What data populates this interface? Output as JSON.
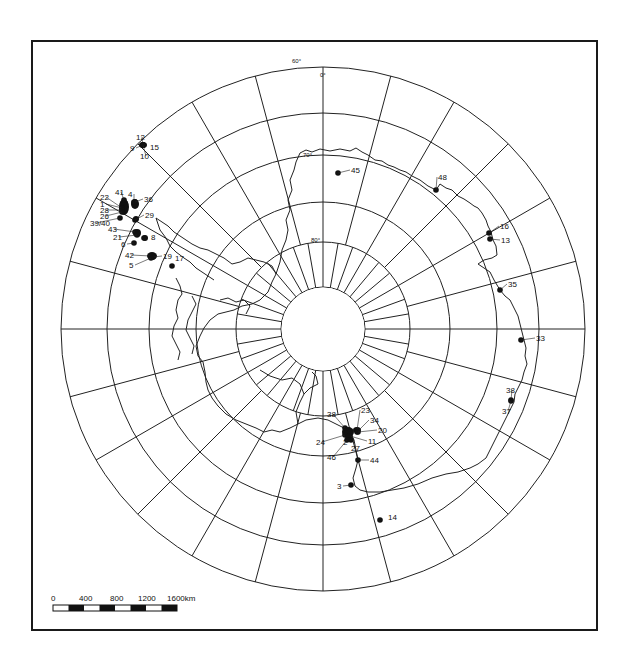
{
  "map": {
    "projection": "south-polar-stereographic",
    "grid_labels": {
      "lat_60": "60°",
      "lon_0": "0°",
      "lat_70": "70°",
      "lat_80": "80°"
    },
    "latitude_rings": [
      "60°",
      "65°",
      "70°",
      "75°",
      "80°",
      "85°"
    ],
    "meridian_spacing_outer_deg": 15,
    "meridian_spacing_inner_deg": 10
  },
  "stations": [
    {
      "label": "12",
      "x": 143,
      "y": 145,
      "lx": 136,
      "ly": 140
    },
    {
      "label": "15",
      "x": 143,
      "y": 145,
      "lx": 150,
      "ly": 150
    },
    {
      "label": "9",
      "x": 143,
      "y": 145,
      "lx": 130,
      "ly": 151
    },
    {
      "label": "10",
      "x": 143,
      "y": 145,
      "lx": 140,
      "ly": 159
    },
    {
      "label": "41",
      "x": 124,
      "y": 200,
      "lx": 115,
      "ly": 195
    },
    {
      "label": "4",
      "x": 134,
      "y": 202,
      "lx": 128,
      "ly": 197
    },
    {
      "label": "36",
      "x": 135,
      "y": 202,
      "lx": 144,
      "ly": 202
    },
    {
      "label": "22",
      "x": 122,
      "y": 208,
      "lx": 100,
      "ly": 200
    },
    {
      "label": "1",
      "x": 122,
      "y": 208,
      "lx": 100,
      "ly": 207
    },
    {
      "label": "28",
      "x": 122,
      "y": 210,
      "lx": 100,
      "ly": 213
    },
    {
      "label": "26",
      "x": 122,
      "y": 212,
      "lx": 100,
      "ly": 219
    },
    {
      "label": "29",
      "x": 135,
      "y": 220,
      "lx": 145,
      "ly": 218
    },
    {
      "label": "39/40",
      "x": 120,
      "y": 218,
      "lx": 90,
      "ly": 226
    },
    {
      "label": "43",
      "x": 135,
      "y": 232,
      "lx": 108,
      "ly": 232
    },
    {
      "label": "21",
      "x": 137,
      "y": 235,
      "lx": 113,
      "ly": 240
    },
    {
      "label": "8",
      "x": 144,
      "y": 238,
      "lx": 151,
      "ly": 240
    },
    {
      "label": "6",
      "x": 134,
      "y": 243,
      "lx": 121,
      "ly": 247
    },
    {
      "label": "42",
      "x": 151,
      "y": 256,
      "lx": 125,
      "ly": 258
    },
    {
      "label": "19",
      "x": 153,
      "y": 257,
      "lx": 163,
      "ly": 259
    },
    {
      "label": "17",
      "x": 172,
      "y": 266,
      "lx": 175,
      "ly": 261
    },
    {
      "label": "5",
      "x": 151,
      "y": 258,
      "lx": 129,
      "ly": 268
    },
    {
      "label": "45",
      "x": 338,
      "y": 173,
      "lx": 351,
      "ly": 173
    },
    {
      "label": "48",
      "x": 436,
      "y": 190,
      "lx": 438,
      "ly": 180
    },
    {
      "label": "16",
      "x": 489,
      "y": 233,
      "lx": 500,
      "ly": 229
    },
    {
      "label": "13",
      "x": 490,
      "y": 239,
      "lx": 501,
      "ly": 243
    },
    {
      "label": "35",
      "x": 500,
      "y": 290,
      "lx": 508,
      "ly": 287
    },
    {
      "label": "33",
      "x": 521,
      "y": 340,
      "lx": 536,
      "ly": 341
    },
    {
      "label": "38",
      "x": 511,
      "y": 400,
      "lx": 506,
      "ly": 393
    },
    {
      "label": "37",
      "x": 511,
      "y": 401,
      "lx": 502,
      "ly": 414
    },
    {
      "label": "38",
      "x": 345,
      "y": 428,
      "lx": 327,
      "ly": 417
    },
    {
      "label": "23",
      "x": 357,
      "y": 430,
      "lx": 361,
      "ly": 413
    },
    {
      "label": "34",
      "x": 357,
      "y": 432,
      "lx": 370,
      "ly": 423
    },
    {
      "label": "20",
      "x": 358,
      "y": 432,
      "lx": 378,
      "ly": 433
    },
    {
      "label": "11",
      "x": 350,
      "y": 436,
      "lx": 368,
      "ly": 444
    },
    {
      "label": "24",
      "x": 345,
      "y": 435,
      "lx": 316,
      "ly": 445
    },
    {
      "label": "2",
      "x": 348,
      "y": 437,
      "lx": 343,
      "ly": 445
    },
    {
      "label": "27",
      "x": 351,
      "y": 440,
      "lx": 351,
      "ly": 451
    },
    {
      "label": "46",
      "x": 347,
      "y": 440,
      "lx": 327,
      "ly": 460
    },
    {
      "label": "44",
      "x": 358,
      "y": 460,
      "lx": 370,
      "ly": 463
    },
    {
      "label": "3",
      "x": 351,
      "y": 485,
      "lx": 337,
      "ly": 489
    },
    {
      "label": "14",
      "x": 380,
      "y": 520,
      "lx": 388,
      "ly": 520
    }
  ],
  "cluster_blobs": [
    {
      "x": 143,
      "y": 145,
      "rx": 4,
      "ry": 3
    },
    {
      "x": 124,
      "y": 207,
      "rx": 5,
      "ry": 8
    },
    {
      "x": 135,
      "y": 204,
      "rx": 4,
      "ry": 5
    },
    {
      "x": 136,
      "y": 219,
      "rx": 3,
      "ry": 3
    },
    {
      "x": 137,
      "y": 233,
      "rx": 4,
      "ry": 4
    },
    {
      "x": 145,
      "y": 238,
      "rx": 3,
      "ry": 3
    },
    {
      "x": 152,
      "y": 256,
      "rx": 5,
      "ry": 4
    },
    {
      "x": 348,
      "y": 432,
      "rx": 6,
      "ry": 5
    },
    {
      "x": 357,
      "y": 430,
      "rx": 4,
      "ry": 3
    }
  ],
  "scale_bar": {
    "ticks": [
      "0",
      "400",
      "800",
      "1200",
      "1600km"
    ],
    "unit": "km"
  }
}
